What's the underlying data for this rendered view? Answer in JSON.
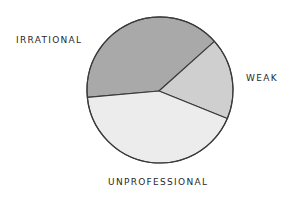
{
  "chart_data": {
    "type": "pie",
    "title": "",
    "xlabel": "",
    "ylabel": "",
    "categories": [
      "IRRATIONAL",
      "WEAK",
      "UNPROFESSIONAL"
    ],
    "values": [
      40,
      18,
      42
    ],
    "unit": "percent (estimated from slice angles)",
    "legend": "none (direct labels)",
    "grid": false,
    "colors": [
      "#a9a9a9",
      "#cfcfcf",
      "#ececec"
    ],
    "stroke_color": "#3a3a3a",
    "geometry": {
      "cx": 160,
      "cy": 90,
      "r": 73,
      "vertex": [
        159,
        91
      ],
      "start_angle_deg": 174.2
    },
    "labels": [
      {
        "text": "IRRATIONAL",
        "x": 16,
        "y": 35
      },
      {
        "text": "WEAK",
        "x": 246,
        "y": 73
      },
      {
        "text": "UNPROFESSIONAL",
        "x": 108,
        "y": 177
      }
    ]
  }
}
